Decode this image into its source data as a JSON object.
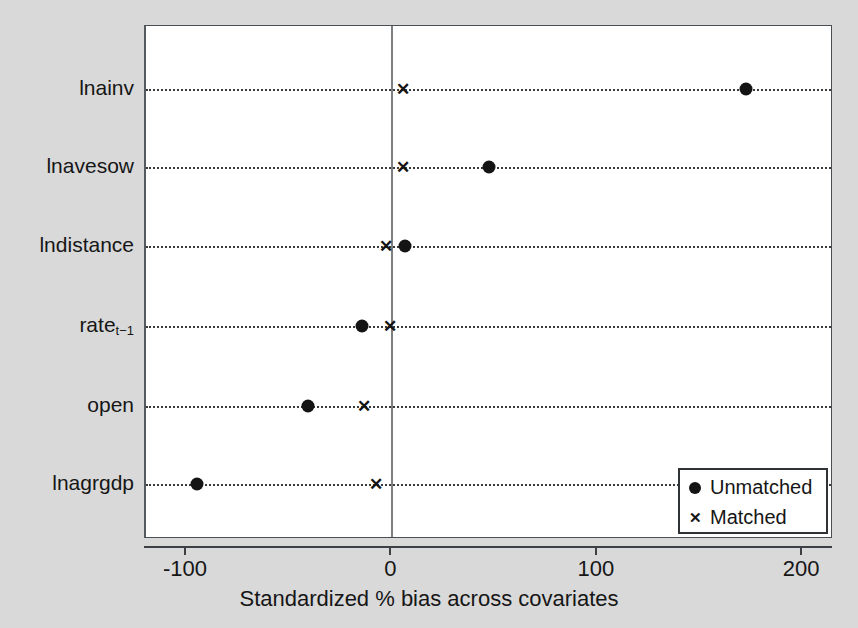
{
  "chart_data": {
    "type": "scatter",
    "title": "",
    "xlabel": "Standardized % bias across covariates",
    "ylabel": "",
    "xlim": [
      -120,
      215
    ],
    "xticks": [
      -100,
      0,
      100,
      200
    ],
    "xtick_labels": [
      "-100",
      "0",
      "100",
      "200"
    ],
    "grid": "dotted horizontal rows",
    "zero_reference_line": 0,
    "legend_position": "bottom-right",
    "categories": [
      "lnainv",
      "lnavesow",
      "lndistance",
      "rate_t-1",
      "open",
      "lnagrgdp"
    ],
    "category_labels": [
      "lnainv",
      "lnavesow",
      "lndistance",
      "rate",
      "open",
      "lnagrgdp"
    ],
    "category_sublabels": [
      "",
      "",
      "",
      "t−1",
      "",
      ""
    ],
    "series": [
      {
        "name": "Unmatched",
        "marker": "filled-circle",
        "color": "#141414",
        "values": [
          172,
          47,
          6,
          -15,
          -41,
          -95
        ]
      },
      {
        "name": "Matched",
        "marker": "x",
        "color": "#141414",
        "values": [
          5,
          5,
          -3,
          -1,
          -14,
          -8
        ]
      }
    ]
  },
  "legend": {
    "entries": [
      {
        "label": "Unmatched",
        "marker": "dot"
      },
      {
        "label": "Matched",
        "marker": "x"
      }
    ]
  },
  "axis": {
    "x_title": "Standardized % bias across covariates"
  },
  "glyphs": {
    "x_marker": "✕"
  },
  "colors": {
    "background": "#d9d9d9",
    "plot_background": "#ffffff",
    "marker": "#141414",
    "axis": "#3c4044",
    "zero_line": "#7d8184"
  }
}
